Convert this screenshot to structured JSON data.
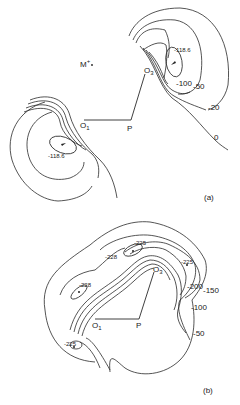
{
  "figure": {
    "panel_a": {
      "label": "(a)",
      "atoms": {
        "O1": "O",
        "O1_sub": "1",
        "O3": "O",
        "O3_sub": "3",
        "P": "P",
        "M": "M",
        "M_sup": "+"
      },
      "contours": {
        "min_upper": "-118.6",
        "min_lower": "-118.6",
        "c100": "-100",
        "c50": "-50",
        "c20": "-20",
        "c0": "0"
      }
    },
    "panel_b": {
      "label": "(b)",
      "atoms": {
        "O1": "O",
        "O1_sub": "1",
        "O3": "O",
        "O3_sub": "3",
        "P": "P"
      },
      "contours": {
        "min_top_a": "-225",
        "min_top_b": "-228",
        "min_right": "-225",
        "min_left_upper": "-228",
        "min_left_lower": "-225",
        "c200": "-200",
        "c150": "-150",
        "c100": "-100",
        "c50": "-50"
      }
    }
  }
}
